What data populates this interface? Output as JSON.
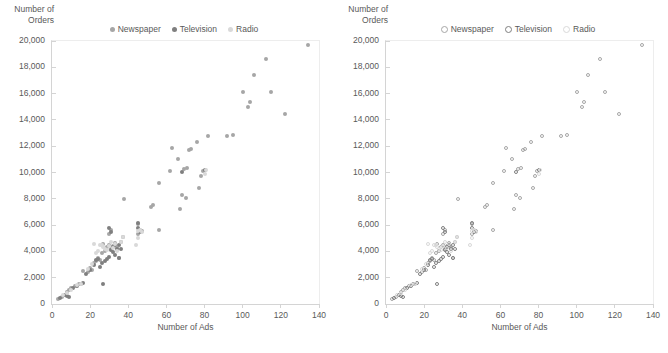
{
  "charts": [
    {
      "panel_name": "scatter-filled",
      "marker_style": "filled",
      "y_axis_title": "Number of\nOrders",
      "x_axis_title": "Number of Ads",
      "legend": [
        {
          "label": "Newspaper",
          "color": "#a6a6a6"
        },
        {
          "label": "Television",
          "color": "#7f7f7f"
        },
        {
          "label": "Radio",
          "color": "#d9d9d9"
        }
      ],
      "y_ticks": [
        "0",
        "2,000",
        "4,000",
        "6,000",
        "8,000",
        "10,000",
        "12,000",
        "14,000",
        "16,000",
        "18,000",
        "20,000"
      ],
      "x_ticks": [
        "0",
        "20",
        "40",
        "60",
        "80",
        "100",
        "120",
        "140"
      ]
    },
    {
      "panel_name": "scatter-hollow",
      "marker_style": "hollow",
      "y_axis_title": "Number of\nOrders",
      "x_axis_title": "Number of Ads",
      "legend": [
        {
          "label": "Newspaper",
          "color": "#a6a6a6"
        },
        {
          "label": "Television",
          "color": "#7f7f7f"
        },
        {
          "label": "Radio",
          "color": "#d9d9d9"
        }
      ],
      "y_ticks": [
        "0",
        "2,000",
        "4,000",
        "6,000",
        "8,000",
        "10,000",
        "12,000",
        "14,000",
        "16,000",
        "18,000",
        "20,000"
      ],
      "x_ticks": [
        "0",
        "20",
        "40",
        "60",
        "80",
        "100",
        "120",
        "140"
      ]
    }
  ],
  "chart_data": {
    "type": "scatter",
    "title": "",
    "xlabel": "Number of Ads",
    "ylabel": "Number of Orders",
    "xlim": [
      0,
      140
    ],
    "ylim": [
      0,
      20000
    ],
    "xtick_step": 20,
    "ytick_step": 2000,
    "grid": false,
    "legend_position": "top-center",
    "note": "Two panels plot the same data; left panel uses filled markers, right panel uses hollow (open) markers.",
    "series": [
      {
        "name": "Newspaper",
        "color": "#a6a6a6",
        "points": [
          [
            3,
            400
          ],
          [
            5,
            560
          ],
          [
            8,
            900
          ],
          [
            9,
            1050
          ],
          [
            10,
            1200
          ],
          [
            12,
            1350
          ],
          [
            14,
            1500
          ],
          [
            15,
            1550
          ],
          [
            16,
            2500
          ],
          [
            19,
            2450
          ],
          [
            20,
            2750
          ],
          [
            21,
            2600
          ],
          [
            22,
            3100
          ],
          [
            23,
            3250
          ],
          [
            24,
            3500
          ],
          [
            25,
            3350
          ],
          [
            26,
            3900
          ],
          [
            27,
            4600
          ],
          [
            28,
            4000
          ],
          [
            29,
            4300
          ],
          [
            30,
            4500
          ],
          [
            30,
            5300
          ],
          [
            31,
            4200
          ],
          [
            31,
            5600
          ],
          [
            32,
            4400
          ],
          [
            33,
            4650
          ],
          [
            34,
            4250
          ],
          [
            35,
            3500
          ],
          [
            36,
            4700
          ],
          [
            37,
            5100
          ],
          [
            38,
            7950
          ],
          [
            45,
            5350
          ],
          [
            45,
            6100
          ],
          [
            46,
            5600
          ],
          [
            47,
            5550
          ],
          [
            52,
            7400
          ],
          [
            53,
            7550
          ],
          [
            56,
            9200
          ],
          [
            56,
            5650
          ],
          [
            67,
            7250
          ],
          [
            68,
            8300
          ],
          [
            70,
            8050
          ],
          [
            71,
            10350
          ],
          [
            77,
            8850
          ],
          [
            78,
            9750
          ],
          [
            79,
            10100
          ],
          [
            63,
            11850
          ],
          [
            66,
            11000
          ],
          [
            62,
            10100
          ],
          [
            69,
            10300
          ],
          [
            72,
            11750
          ],
          [
            73,
            11800
          ],
          [
            76,
            12350
          ],
          [
            82,
            12800
          ],
          [
            92,
            12800
          ],
          [
            95,
            12850
          ],
          [
            100,
            16150
          ],
          [
            103,
            14950
          ],
          [
            104,
            15400
          ],
          [
            106,
            17400
          ],
          [
            112,
            18600
          ],
          [
            115,
            16150
          ],
          [
            122,
            14450
          ],
          [
            134,
            19700
          ]
        ]
      },
      {
        "name": "Television",
        "color": "#7f7f7f",
        "points": [
          [
            4,
            480
          ],
          [
            7,
            700
          ],
          [
            8,
            620
          ],
          [
            9,
            560
          ],
          [
            11,
            1250
          ],
          [
            13,
            1400
          ],
          [
            16,
            1600
          ],
          [
            18,
            2300
          ],
          [
            20,
            2550
          ],
          [
            22,
            3000
          ],
          [
            23,
            3350
          ],
          [
            24,
            3450
          ],
          [
            25,
            2850
          ],
          [
            26,
            3150
          ],
          [
            27,
            1550
          ],
          [
            28,
            3300
          ],
          [
            29,
            3450
          ],
          [
            30,
            3600
          ],
          [
            30,
            5750
          ],
          [
            31,
            4100
          ],
          [
            31,
            5500
          ],
          [
            32,
            3950
          ],
          [
            32,
            4350
          ],
          [
            33,
            3750
          ],
          [
            33,
            4450
          ],
          [
            34,
            4150
          ],
          [
            35,
            4500
          ],
          [
            35,
            3500
          ],
          [
            36,
            4150
          ],
          [
            45,
            6150
          ],
          [
            45,
            5800
          ],
          [
            46,
            5450
          ],
          [
            68,
            10050
          ],
          [
            80,
            10200
          ]
        ]
      },
      {
        "name": "Radio",
        "color": "#d9d9d9",
        "points": [
          [
            6,
            650
          ],
          [
            8,
            800
          ],
          [
            10,
            1100
          ],
          [
            13,
            1450
          ],
          [
            15,
            1500
          ],
          [
            19,
            2700
          ],
          [
            21,
            3050
          ],
          [
            22,
            4600
          ],
          [
            23,
            3850
          ],
          [
            24,
            4050
          ],
          [
            25,
            4500
          ],
          [
            26,
            4450
          ],
          [
            27,
            4300
          ],
          [
            28,
            4200
          ],
          [
            29,
            4100
          ],
          [
            30,
            4400
          ],
          [
            31,
            4700
          ],
          [
            32,
            4250
          ],
          [
            33,
            4550
          ],
          [
            34,
            4000
          ],
          [
            36,
            4750
          ],
          [
            37,
            5100
          ],
          [
            44,
            4450
          ],
          [
            45,
            5050
          ],
          [
            45,
            5550
          ],
          [
            46,
            5600
          ],
          [
            47,
            5500
          ],
          [
            80,
            9850
          ],
          [
            81,
            10200
          ]
        ]
      }
    ]
  }
}
